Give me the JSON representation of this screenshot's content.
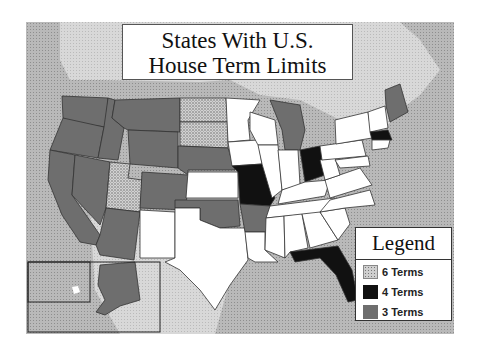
{
  "title": {
    "line1": "States With U.S.",
    "line2": "House Term Limits"
  },
  "legend": {
    "title": "Legend",
    "items": [
      {
        "label": "6 Terms",
        "pattern": "speckled",
        "color": "#cfcfcf"
      },
      {
        "label": "4 Terms",
        "pattern": "solid",
        "color": "#111111"
      },
      {
        "label": "3 Terms",
        "pattern": "solid",
        "color": "#6e6e6e"
      }
    ]
  },
  "states": {
    "six_terms": [
      "Utah",
      "North Dakota",
      "South Dakota"
    ],
    "four_terms": [
      "Missouri",
      "Ohio",
      "Massachusetts",
      "Florida"
    ],
    "three_terms": [
      "Washington",
      "Oregon",
      "California",
      "Idaho",
      "Nevada",
      "Arizona",
      "Montana",
      "Wyoming",
      "Colorado",
      "Nebraska",
      "Oklahoma",
      "Arkansas",
      "Michigan",
      "Maine",
      "Alaska"
    ],
    "no_limits_shown_white": [
      "New Mexico",
      "Texas",
      "Kansas",
      "Minnesota",
      "Iowa",
      "Wisconsin",
      "Illinois",
      "Indiana",
      "Louisiana",
      "Mississippi",
      "Alabama",
      "Georgia",
      "Tennessee",
      "Kentucky",
      "South Carolina",
      "North Carolina",
      "Virginia",
      "West Virginia",
      "Pennsylvania",
      "New York",
      "Vermont",
      "New Hampshire",
      "Connecticut",
      "New Jersey",
      "Maryland",
      "Delaware",
      "Rhode Island",
      "Hawaii"
    ]
  },
  "colors": {
    "water": "#b9b9b9",
    "land_other": "#d6d6d6",
    "border": "#333333"
  }
}
